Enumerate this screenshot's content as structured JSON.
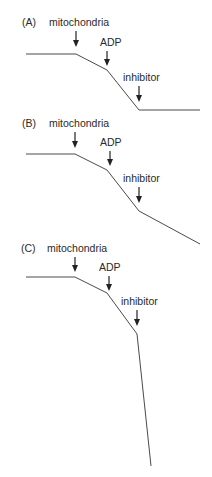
{
  "panels": [
    {
      "id": "A",
      "label": "(A)",
      "annotations": [
        {
          "text": "mitochondria",
          "arrow_x": 76
        },
        {
          "text": "ADP",
          "arrow_x": 107
        },
        {
          "text": "inhibitor",
          "arrow_x": 139
        }
      ],
      "trace_points": [
        [
          26,
          54
        ],
        [
          76,
          54
        ],
        [
          107,
          70
        ],
        [
          139,
          110
        ],
        [
          200,
          110
        ]
      ]
    },
    {
      "id": "B",
      "label": "(B)",
      "annotations": [
        {
          "text": "mitochondria",
          "arrow_x": 75
        },
        {
          "text": "ADP",
          "arrow_x": 107
        },
        {
          "text": "inhibitor",
          "arrow_x": 139
        }
      ],
      "trace_points": [
        [
          26,
          154
        ],
        [
          75,
          154
        ],
        [
          107,
          170
        ],
        [
          139,
          211
        ],
        [
          200,
          244
        ]
      ]
    },
    {
      "id": "C",
      "label": "(C)",
      "annotations": [
        {
          "text": "mitochondria",
          "arrow_x": 75
        },
        {
          "text": "ADP",
          "arrow_x": 109
        },
        {
          "text": "inhibitor",
          "arrow_x": 137
        }
      ],
      "trace_points": [
        [
          26,
          277
        ],
        [
          75,
          277
        ],
        [
          107,
          293
        ],
        [
          137,
          334
        ],
        [
          151,
          466
        ]
      ]
    }
  ]
}
